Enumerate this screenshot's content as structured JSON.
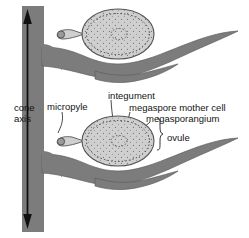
{
  "figure": {
    "background_color": "#ffffff",
    "width": 249,
    "height": 238
  },
  "colors": {
    "scale_gray": "#7c7c7c",
    "scale_outline": "#4a4a4a",
    "ovule_fill": "#cfcfcf",
    "ovule_outline": "#5a5a5a",
    "dotted_ink": "#3b3b3b",
    "text": "#141414",
    "arrow": "#101010",
    "axis_gray": "#7c7c7c"
  },
  "labels": {
    "cone_axis_line1": "cone",
    "cone_axis_line2": "axis",
    "micropyle": "micropyle",
    "integument": "integument",
    "megaspore_mother_cell": "megaspore mother cell",
    "megasporangium": "megasporangium",
    "ovule": "ovule"
  },
  "structures": {
    "axis": "cone axis",
    "arrow": "double-headed vertical axis arrow",
    "ovules": 2,
    "scales_per_ovule": 2,
    "scale_types": [
      "ovuliferous scale",
      "bract scale"
    ]
  }
}
